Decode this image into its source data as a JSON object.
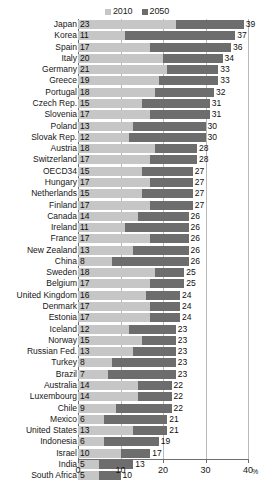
{
  "legend": {
    "entries": [
      {
        "label": "2010",
        "color": "#c6c6c6",
        "icon": "legend-swatch-icon"
      },
      {
        "label": "2050",
        "color": "#6d6d6d",
        "icon": "legend-swatch-icon"
      }
    ]
  },
  "axis": {
    "unit": "%",
    "ticks": [
      "0",
      "10",
      "20",
      "30",
      "40"
    ]
  },
  "chart_data": {
    "type": "bar",
    "orientation": "horizontal",
    "title": "",
    "xlabel": "%",
    "ylabel": "",
    "xlim": [
      0,
      40
    ],
    "grid": true,
    "legend_position": "top-center",
    "note": "Each row shows a light bar from 0 to the 2010 value, then a dark bar extending from the 2010 value to the 2050 value.",
    "categories": [
      "Japan",
      "Korea",
      "Spain",
      "Italy",
      "Germany",
      "Greece",
      "Portugal",
      "Czech Rep.",
      "Slovenia",
      "Poland",
      "Slovak Rep.",
      "Austria",
      "Switzerland",
      "OECD34",
      "Hungary",
      "Netherlands",
      "Finland",
      "Canada",
      "Ireland",
      "France",
      "New Zealand",
      "China",
      "Sweden",
      "Belgium",
      "United Kingdom",
      "Denmark",
      "Estonia",
      "Iceland",
      "Norway",
      "Russian Fed.",
      "Turkey",
      "Brazil",
      "Australia",
      "Luxembourg",
      "Chile",
      "Mexico",
      "United States",
      "Indonesia",
      "Israel",
      "India",
      "South Africa"
    ],
    "series": [
      {
        "name": "2010",
        "color": "#c6c6c6",
        "values": [
          23,
          11,
          17,
          20,
          21,
          19,
          18,
          15,
          17,
          13,
          12,
          18,
          17,
          15,
          17,
          15,
          17,
          14,
          11,
          17,
          13,
          8,
          18,
          17,
          16,
          17,
          17,
          12,
          15,
          13,
          8,
          7,
          14,
          14,
          9,
          6,
          13,
          6,
          10,
          5,
          5
        ]
      },
      {
        "name": "2050",
        "color": "#6d6d6d",
        "values": [
          39,
          37,
          36,
          34,
          33,
          33,
          32,
          31,
          31,
          30,
          30,
          28,
          28,
          27,
          27,
          27,
          27,
          26,
          26,
          26,
          26,
          26,
          25,
          25,
          24,
          24,
          24,
          23,
          23,
          23,
          23,
          23,
          22,
          22,
          22,
          21,
          21,
          19,
          17,
          13,
          10
        ]
      }
    ]
  }
}
